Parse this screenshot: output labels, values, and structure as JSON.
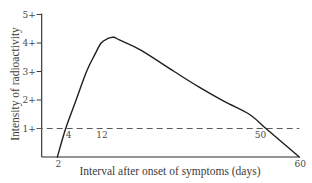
{
  "chart_data": {
    "type": "line",
    "title": "",
    "xlabel": "Interval after onset of symptoms (days)",
    "ylabel": "Intensity of radioactivity",
    "xlim": [
      -1.75,
      60
    ],
    "ylim": [
      0,
      5
    ],
    "grid": false,
    "legend": "none",
    "y_ticks": [
      {
        "value": 1,
        "label": "1+"
      },
      {
        "value": 2,
        "label": "2+"
      },
      {
        "value": 3,
        "label": "3+"
      },
      {
        "value": 4,
        "label": "4+"
      },
      {
        "value": 5,
        "label": "5+"
      }
    ],
    "x_ticks": [
      {
        "value": 2,
        "label": "2"
      },
      {
        "value": 60,
        "label": "60"
      }
    ],
    "reference_line": {
      "y": 1,
      "style": "dashed",
      "x_end": 60
    },
    "annotations": [
      {
        "text": "4",
        "x": 4,
        "y": 1
      },
      {
        "text": "12",
        "x": 12,
        "y": 1
      },
      {
        "text": "50",
        "x": 50,
        "y": 1
      }
    ],
    "series": [
      {
        "name": "Intensity of radioactivity",
        "x": [
          2,
          4,
          6.5,
          9,
          11,
          12.5,
          14,
          15.5,
          17,
          22,
          30,
          36,
          42,
          48,
          52,
          56,
          60
        ],
        "y": [
          0,
          1.0,
          2.0,
          3.0,
          3.6,
          4.0,
          4.15,
          4.2,
          4.1,
          3.75,
          3.0,
          2.45,
          1.95,
          1.5,
          1.0,
          0.5,
          0
        ]
      }
    ],
    "colors": {
      "curve": "#1e1e1e",
      "axis": "#2a2a2a",
      "reference": "#5a5a5a",
      "text": "#4a4a4a"
    }
  }
}
